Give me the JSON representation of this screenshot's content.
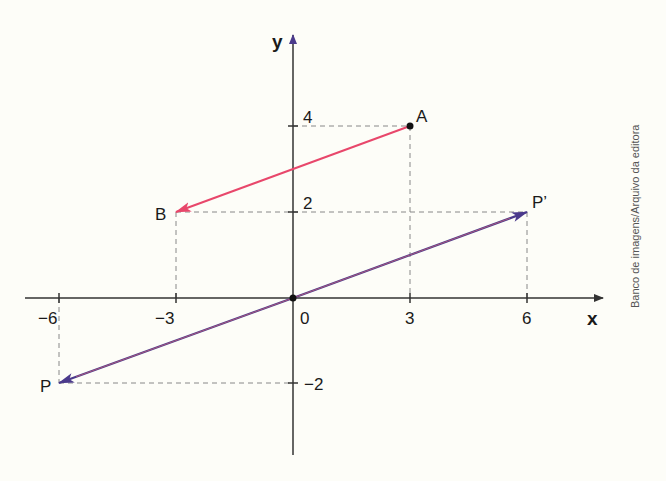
{
  "diagram": {
    "axes": {
      "x_label": "x",
      "y_label": "y",
      "origin_label": "0",
      "x_ticks": [
        {
          "value": -6,
          "label": "−6"
        },
        {
          "value": -3,
          "label": "−3"
        },
        {
          "value": 3,
          "label": "3"
        },
        {
          "value": 6,
          "label": "6"
        }
      ],
      "y_ticks": [
        {
          "value": 4,
          "label": "4"
        },
        {
          "value": 2,
          "label": "2"
        },
        {
          "value": -2,
          "label": "−2"
        }
      ]
    },
    "points": {
      "A": {
        "label": "A",
        "x": 3,
        "y": 4
      },
      "B": {
        "label": "B",
        "x": -3,
        "y": 2
      },
      "P": {
        "label": "P",
        "x": -6,
        "y": -2
      },
      "P_prime": {
        "label": "P’",
        "x": 6,
        "y": 2
      },
      "O": {
        "label": "0",
        "x": 0,
        "y": 0
      }
    },
    "vectors": [
      {
        "name": "AB",
        "from": "A",
        "to": "B",
        "color": "#e8476b"
      },
      {
        "name": "OP_prime",
        "from": "O",
        "to": "P_prime",
        "color": "#4b3a8c"
      },
      {
        "name": "OP",
        "from": "O",
        "to": "P",
        "color": "#4b3a8c"
      }
    ],
    "colors": {
      "axis": "#333333",
      "guide": "#888888",
      "vector_ab": "#e8476b",
      "vector_p": "#4b3a8c",
      "vector_p_overlay": "#c0607a"
    },
    "credit": "Banco de imagens/Arquivo da editora"
  }
}
